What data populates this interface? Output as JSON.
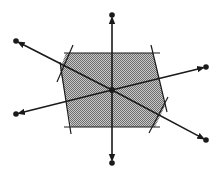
{
  "diagram": {
    "title": "",
    "colors": {
      "stroke": "#1a1a1a",
      "fill": "#9a9a9a",
      "background": "#ffffff"
    },
    "center": [
      112,
      90
    ],
    "polygon": [
      [
        66,
        53
      ],
      [
        153,
        53
      ],
      [
        165,
        106
      ],
      [
        155,
        127
      ],
      [
        71,
        127
      ],
      [
        60,
        69
      ]
    ],
    "constraint_lines": [
      [
        [
          64,
          53
        ],
        [
          160,
          53
        ]
      ],
      [
        [
          64,
          127
        ],
        [
          160,
          127
        ]
      ],
      [
        [
          73,
          45
        ],
        [
          57,
          82
        ]
      ],
      [
        [
          60,
          62
        ],
        [
          71,
          134
        ]
      ],
      [
        [
          151,
          45
        ],
        [
          167,
          112
        ]
      ],
      [
        [
          168,
          97
        ],
        [
          149,
          133
        ]
      ]
    ],
    "rays": [
      {
        "name": "ray-top",
        "end": [
          112,
          15
        ]
      },
      {
        "name": "ray-bottom",
        "end": [
          112,
          163
        ]
      },
      {
        "name": "ray-upper-left",
        "end": [
          16,
          41
        ]
      },
      {
        "name": "ray-lower-right",
        "end": [
          206,
          140
        ]
      },
      {
        "name": "ray-lower-left",
        "end": [
          16,
          114
        ]
      },
      {
        "name": "ray-upper-right",
        "end": [
          206,
          67
        ]
      }
    ]
  }
}
